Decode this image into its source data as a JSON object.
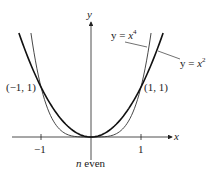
{
  "chart_data": {
    "type": "line",
    "title": "",
    "caption": "n even",
    "xlabel": "x",
    "ylabel": "y",
    "xticks": [
      -1,
      1
    ],
    "xlim": [
      -1.8,
      2.2
    ],
    "ylim": [
      0,
      2.1
    ],
    "grid": false,
    "series": [
      {
        "name": "y = x^4",
        "label": "y = x⁴",
        "function": "x^4",
        "weight": "thin"
      },
      {
        "name": "y = x^2",
        "label": "y = x²",
        "function": "x^2",
        "weight": "thick"
      }
    ],
    "annotations": [
      {
        "text": "(−1, 1)",
        "x": -1,
        "y": 1
      },
      {
        "text": "(1, 1)",
        "x": 1,
        "y": 1
      }
    ]
  },
  "labels": {
    "y_axis": "y",
    "x_axis": "x",
    "tick_neg1": "−1",
    "tick_1": "1",
    "point_left": "(−1, 1)",
    "point_right": "(1, 1)",
    "curve_x4_prefix": "y = ",
    "curve_x4_var": "x",
    "curve_x4_exp": "4",
    "curve_x2_prefix": "y = ",
    "curve_x2_var": "x",
    "curve_x2_exp": "2",
    "caption_n": "n",
    "caption_rest": " even"
  }
}
